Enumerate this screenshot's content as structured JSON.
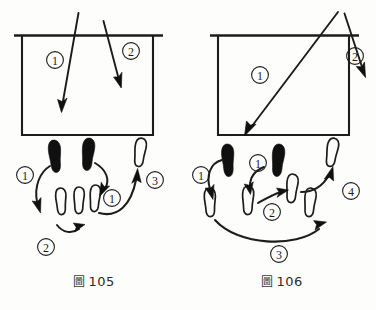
{
  "document": {
    "kind": "scanned-book-illustration",
    "page_background": "#fdfdfc",
    "ink_color": "#1c1c1c"
  },
  "figures": [
    {
      "id": "fig-105",
      "caption_word": "圖",
      "caption_number": "105",
      "caption_full": "圖 105",
      "room": {
        "description": "open-top rectangle with extended lintel line",
        "attack_arrows": [
          {
            "label": "①",
            "label_text": "1",
            "from": [
              78,
              14
            ],
            "to": [
              62,
              110
            ]
          },
          {
            "label": "②",
            "label_text": "2",
            "from": [
              104,
              22
            ],
            "to": [
              121,
              86
            ]
          }
        ],
        "arrow_labels": [
          {
            "label": "①",
            "x": 55,
            "y": 60
          },
          {
            "label": "②",
            "x": 131,
            "y": 51
          }
        ]
      },
      "footprints": [
        {
          "type": "solid",
          "x": 55,
          "y": 156,
          "rot": -6,
          "name": "left-start-solid"
        },
        {
          "type": "solid",
          "x": 88,
          "y": 154,
          "rot": 4,
          "name": "right-start-solid"
        },
        {
          "type": "outline",
          "x": 140,
          "y": 152,
          "rot": 6,
          "name": "right-end-outline"
        },
        {
          "type": "outline",
          "x": 61,
          "y": 201,
          "rot": -4,
          "name": "lower-outline-a"
        },
        {
          "type": "outline",
          "x": 79,
          "y": 200,
          "rot": 0,
          "name": "lower-outline-b"
        },
        {
          "type": "outline",
          "x": 95,
          "y": 198,
          "rot": 3,
          "name": "lower-outline-c"
        }
      ],
      "step_arrows": [
        {
          "label": "①",
          "label_text": "1",
          "label_x": 25,
          "label_y": 175,
          "name": "step-1-left"
        },
        {
          "label": "②",
          "label_text": "2",
          "label_x": 46,
          "label_y": 247,
          "name": "step-2-lower"
        },
        {
          "label": "①",
          "label_text": "1",
          "label_x": 112,
          "label_y": 198,
          "name": "step-1-right"
        },
        {
          "label": "③",
          "label_text": "3",
          "label_x": 147,
          "label_y": 180,
          "name": "step-3-up"
        }
      ]
    },
    {
      "id": "fig-106",
      "caption_word": "圖",
      "caption_number": "106",
      "caption_full": "圖 106",
      "room": {
        "description": "open-top rectangle with extended lintel line",
        "attack_arrows": [
          {
            "label": "①",
            "label_text": "1",
            "from": [
              150,
              12
            ],
            "to": [
              59,
              133
            ]
          },
          {
            "label": "②",
            "label_text": "2",
            "from": [
              157,
              14
            ],
            "to": [
              177,
              75
            ]
          }
        ],
        "arrow_labels": [
          {
            "label": "①",
            "x": 72,
            "y": 75
          },
          {
            "label": "②",
            "x": 167,
            "y": 56
          }
        ]
      },
      "footprints": [
        {
          "type": "solid",
          "x": 40,
          "y": 160,
          "rot": -4,
          "name": "left-solid"
        },
        {
          "type": "solid",
          "x": 90,
          "y": 160,
          "rot": 4,
          "name": "right-solid"
        },
        {
          "type": "outline",
          "x": 22,
          "y": 202,
          "rot": -3,
          "name": "left-outline-low"
        },
        {
          "type": "outline",
          "x": 60,
          "y": 200,
          "rot": 0,
          "name": "mid-outline-low"
        },
        {
          "type": "outline",
          "x": 104,
          "y": 188,
          "rot": 4,
          "name": "right-outline-mid"
        },
        {
          "type": "outline",
          "x": 122,
          "y": 202,
          "rot": 4,
          "name": "right-outline-low"
        },
        {
          "type": "outline",
          "x": 144,
          "y": 152,
          "rot": 8,
          "name": "right-outline-top"
        }
      ],
      "step_arrows": [
        {
          "label": "①",
          "label_text": "1",
          "label_x": 13,
          "label_y": 175,
          "name": "step-1-left"
        },
        {
          "label": "①",
          "label_text": "1",
          "label_x": 70,
          "label_y": 163,
          "name": "step-1-mid"
        },
        {
          "label": "②",
          "label_text": "2",
          "label_x": 84,
          "label_y": 212,
          "name": "step-2-mid"
        },
        {
          "label": "③",
          "label_text": "3",
          "label_x": 91,
          "label_y": 254,
          "name": "step-3-arc"
        },
        {
          "label": "④",
          "label_text": "4",
          "label_x": 163,
          "label_y": 191,
          "name": "step-4-up"
        }
      ]
    }
  ]
}
